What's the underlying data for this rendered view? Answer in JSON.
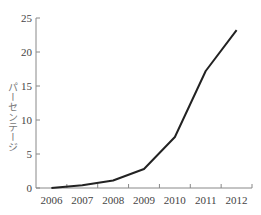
{
  "chart_data": {
    "type": "line",
    "title": "",
    "xlabel": "",
    "ylabel": "パーセンテージ",
    "x": [
      "2006",
      "2007",
      "2008",
      "2009",
      "2010",
      "2011",
      "2012"
    ],
    "series": [
      {
        "name": "パーセンテージ",
        "values": [
          0.0,
          0.4,
          1.1,
          2.8,
          7.5,
          17.2,
          23.2
        ],
        "color": "#222222"
      }
    ],
    "ylim": [
      0,
      25
    ],
    "yticks": [
      0,
      5,
      10,
      15,
      20,
      25
    ],
    "grid": false,
    "legend": "none"
  }
}
